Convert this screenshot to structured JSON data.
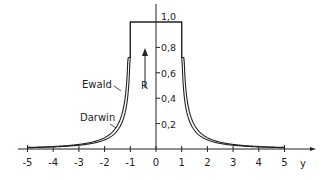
{
  "chart_data": {
    "type": "line",
    "title": "",
    "xlabel": "y",
    "ylabel": "R",
    "xlim": [
      -5,
      5
    ],
    "ylim": [
      0,
      1.0
    ],
    "grid": false,
    "x_ticks": [
      "-5",
      "-4",
      "-3",
      "-2",
      "-1",
      "0",
      "1",
      "2",
      "3",
      "4",
      "5"
    ],
    "y_ticks": [
      "0,2",
      "0,4",
      "0,6",
      "0,8",
      "1,0"
    ],
    "series": [
      {
        "name": "Darwin",
        "x": [
          -5,
          -4,
          -3,
          -2,
          -1.5,
          -1.2,
          -1.05,
          -1,
          1,
          1.05,
          1.2,
          1.5,
          2,
          3,
          4,
          5
        ],
        "values": [
          0.01,
          0.016,
          0.03,
          0.072,
          0.146,
          0.3,
          0.53,
          1.0,
          1.0,
          0.53,
          0.3,
          0.146,
          0.072,
          0.03,
          0.016,
          0.01
        ]
      },
      {
        "name": "Ewald",
        "x": [
          -5,
          -4,
          -3,
          -2,
          -1.5,
          -1.2,
          -1.05,
          -1,
          1,
          1.05,
          1.2,
          1.5,
          2,
          3,
          4,
          5
        ],
        "values": [
          0.015,
          0.025,
          0.045,
          0.11,
          0.22,
          0.4,
          0.65,
          1.0,
          1.0,
          0.65,
          0.4,
          0.22,
          0.11,
          0.045,
          0.025,
          0.015
        ]
      }
    ],
    "annotations": [
      {
        "text": "Ewald",
        "points_to": "outer curve"
      },
      {
        "text": "Darwin",
        "points_to": "inner curve"
      },
      {
        "text": "R",
        "with_arrow": "up"
      }
    ]
  },
  "labels": {
    "ewald": "Ewald",
    "darwin": "Darwin",
    "r_label": "R",
    "x_axis_label": "y"
  }
}
